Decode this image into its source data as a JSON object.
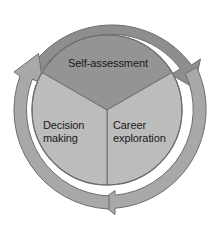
{
  "diagram": {
    "type": "three-segment circular cycle with outer arrows",
    "segments": [
      {
        "id": "self-assessment",
        "label": "Self-assessment",
        "position": "top",
        "fill": "#949494",
        "start_angle_deg": -150,
        "end_angle_deg": -30
      },
      {
        "id": "career-exploration",
        "label": "Career\nexploration",
        "position": "bottom-right",
        "fill": "#bcbcbc",
        "start_angle_deg": -30,
        "end_angle_deg": 90
      },
      {
        "id": "decision-making",
        "label": "Decision\nmaking",
        "position": "bottom-left",
        "fill": "#bcbcbc",
        "start_angle_deg": 90,
        "end_angle_deg": 210
      }
    ],
    "arrows": [
      {
        "id": "arrow-top",
        "fill": "#8e8e8e",
        "direction": "clockwise",
        "from_angle_deg": 198,
        "to_angle_deg": 332,
        "head": "top-right"
      },
      {
        "id": "arrow-right",
        "fill": "#a8a8a8",
        "direction": "clockwise",
        "from_angle_deg": 335,
        "to_angle_deg": 95,
        "head": "bottom-center"
      },
      {
        "id": "arrow-left",
        "fill": "#a8a8a8",
        "direction": "clockwise",
        "from_angle_deg": 98,
        "to_angle_deg": 194,
        "head": "top-left"
      }
    ],
    "geometry": {
      "center_x": 107,
      "center_y": 110,
      "inner_circle_radius": 75,
      "ring_inner_radius": 86,
      "ring_outer_radius": 99,
      "divider_color": "#6e6e6e"
    },
    "colors": {
      "background": "#ffffff",
      "segment_dark": "#949494",
      "segment_light": "#bcbcbc",
      "arrow_dark": "#8e8e8e",
      "arrow_light": "#a8a8a8",
      "outline": "#6e6e6e",
      "text": "#1a1a1a"
    }
  }
}
